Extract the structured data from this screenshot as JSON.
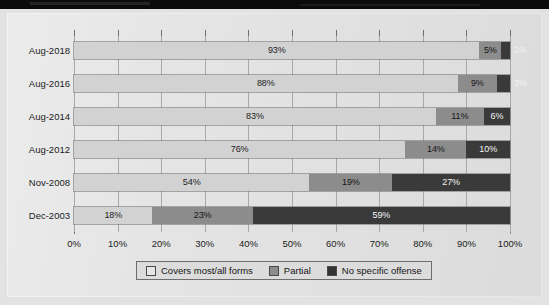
{
  "chart_data": {
    "type": "bar",
    "orientation": "horizontal",
    "stacked": true,
    "normalized": "100%",
    "title": "",
    "xlabel": "",
    "ylabel": "",
    "xlim": [
      0,
      100
    ],
    "grid": true,
    "legend_position": "bottom",
    "categories": [
      "Aug-2018",
      "Aug-2016",
      "Aug-2014",
      "Aug-2012",
      "Nov-2008",
      "Dec-2003"
    ],
    "series": [
      {
        "name": "Covers most/all forms",
        "color": "#d2d2d2",
        "values": [
          93,
          88,
          83,
          76,
          54,
          18
        ]
      },
      {
        "name": "Partial",
        "color": "#8c8c8c",
        "values": [
          5,
          9,
          11,
          14,
          19,
          23
        ]
      },
      {
        "name": "No specific offense",
        "color": "#3a3a3a",
        "values": [
          2,
          3,
          6,
          10,
          27,
          59
        ]
      }
    ],
    "data_labels": [
      [
        "93%",
        "5%",
        "2%"
      ],
      [
        "88%",
        "9%",
        "3%"
      ],
      [
        "83%",
        "11%",
        "6%"
      ],
      [
        "76%",
        "14%",
        "10%"
      ],
      [
        "54%",
        "19%",
        "27%"
      ],
      [
        "18%",
        "23%",
        "59%"
      ]
    ],
    "label_outside": [
      [
        false,
        false,
        true
      ],
      [
        false,
        false,
        true
      ],
      [
        false,
        false,
        false
      ],
      [
        false,
        false,
        false
      ],
      [
        false,
        false,
        false
      ],
      [
        false,
        false,
        false
      ]
    ],
    "xticks": [
      0,
      10,
      20,
      30,
      40,
      50,
      60,
      70,
      80,
      90,
      100
    ],
    "xtick_labels": [
      "0%",
      "10%",
      "20%",
      "30%",
      "40%",
      "50%",
      "60%",
      "70%",
      "80%",
      "90%",
      "100%"
    ]
  },
  "legend": {
    "items": [
      {
        "label": "Covers most/all forms"
      },
      {
        "label": "Partial"
      },
      {
        "label": "No specific offense"
      }
    ]
  }
}
